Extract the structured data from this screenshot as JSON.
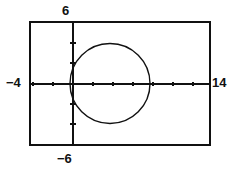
{
  "graph": {
    "title": "graphing-calculator-window",
    "window": {
      "xmin_label": "−4",
      "xmax_label": "14",
      "ymin_label": "−6",
      "ymax_label": "6"
    },
    "frame": {
      "left": 30,
      "top": 22,
      "right": 210,
      "bottom": 145,
      "stroke": "#111111",
      "stroke_width": 2.2
    },
    "axes": {
      "x_axis_y": 84,
      "y_axis_x": 73,
      "tick_spacing_x": 20,
      "tick_spacing_y": 20.5,
      "tick_len_x": 4,
      "tick_len_y": 4,
      "stroke": "#111111",
      "stroke_width": 2
    },
    "ticks": {
      "x_positions": [
        33,
        53,
        93,
        113,
        133,
        153,
        173,
        193
      ],
      "y_positions": [
        43,
        63,
        104,
        124
      ]
    }
  },
  "chart_data": {
    "type": "scatter",
    "title": "",
    "xlabel": "",
    "ylabel": "",
    "xlim": [
      -4,
      14
    ],
    "ylim": [
      -6,
      6
    ],
    "xticks": [
      -4,
      -2,
      0,
      2,
      4,
      6,
      8,
      10,
      12,
      14
    ],
    "yticks": [
      -6,
      -4,
      -2,
      0,
      2,
      4,
      6
    ],
    "grid": false,
    "legend": null,
    "annotations": [
      {
        "text": "6",
        "position": "top",
        "value": 6
      },
      {
        "text": "−6",
        "position": "bottom",
        "value": -6
      },
      {
        "text": "−4",
        "position": "left",
        "value": -4
      },
      {
        "text": "14",
        "position": "right",
        "value": 14
      }
    ],
    "series": [
      {
        "name": "circle",
        "shape": "circle",
        "center_x": 4,
        "center_y": 0,
        "radius": 4,
        "stroke": "#111111",
        "stroke_width": 1.4,
        "fill": "none"
      }
    ]
  }
}
